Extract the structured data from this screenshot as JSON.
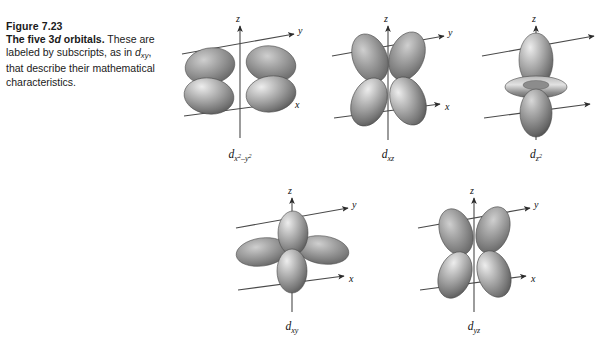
{
  "figure": {
    "number": "Figure 7.23",
    "title_lead": "The five 3d orbitals.",
    "title_lead_plain": "The five 3d orbitals.",
    "body_text": "These are labeled by subscripts, as in dxy, that describe their mathematical characteristics.",
    "body_part_1": "These",
    "body_part_2": "are labeled by subscripts, as in",
    "body_part_3": ", that describe their mathematical characteristics.",
    "inline_symbol": "d",
    "inline_symbol_sub": "xy"
  },
  "style": {
    "background": "#ffffff",
    "text_color": "#1a1a1a",
    "axis_color": "#4a4a4a",
    "lobe_light": "#e8e8e8",
    "lobe_mid": "#9a9a9a",
    "lobe_dark": "#5a5a5a",
    "lobe_edge": "#3c3c3c"
  },
  "axes": {
    "z_label": "z",
    "y_label": "y",
    "x_label": "x"
  },
  "orbitals": [
    {
      "id": "dx2y2",
      "name": "d x squared minus y squared",
      "label_base": "d",
      "label_sub_pre": "x",
      "label_sub_sup1": "2",
      "label_sub_mid": "–y",
      "label_sub_sup2": "2",
      "lobe_count": 4,
      "orientation": "lobes along x and y axes, in the xy plane",
      "row": 1,
      "column": 1
    },
    {
      "id": "dxz",
      "name": "d xz",
      "label_base": "d",
      "label_sub": "xz",
      "lobe_count": 4,
      "orientation": "lobes between x and z axes",
      "row": 1,
      "column": 2
    },
    {
      "id": "dz2",
      "name": "d z squared",
      "label_base": "d",
      "label_sub_pre": "z",
      "label_sub_sup1": "2",
      "lobe_count": 2,
      "has_torus": true,
      "orientation": "two lobes along z axis with a torus ring in the xy plane",
      "row": 1,
      "column": 3,
      "clipped_at_right_edge": true
    },
    {
      "id": "dxy",
      "name": "d xy",
      "label_base": "d",
      "label_sub": "xy",
      "lobe_count": 4,
      "orientation": "lobes between x and y axes",
      "row": 2,
      "column": 1
    },
    {
      "id": "dyz",
      "name": "d yz",
      "label_base": "d",
      "label_sub": "yz",
      "lobe_count": 4,
      "orientation": "lobes between y and z axes",
      "row": 2,
      "column": 2
    }
  ]
}
